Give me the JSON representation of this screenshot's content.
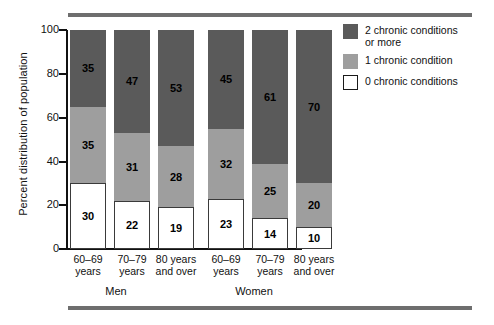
{
  "chart_data": {
    "type": "bar",
    "subtype": "stacked-bar-100",
    "title": "",
    "xlabel": "",
    "ylabel": "Percent distribution of population",
    "ylim": [
      0,
      100
    ],
    "yticks": [
      0,
      20,
      40,
      60,
      80,
      100
    ],
    "ytick_labels": [
      "0",
      "20",
      "40",
      "60",
      "80",
      "100"
    ],
    "grid": false,
    "legend_position": "right",
    "groups": [
      {
        "name": "Men",
        "categories": [
          "60–69 years",
          "70–79 years",
          "80 years and over"
        ]
      },
      {
        "name": "Women",
        "categories": [
          "60–69 years",
          "70–79 years",
          "80 years and over"
        ]
      }
    ],
    "categories": [
      "Men 60–69 years",
      "Men 70–79 years",
      "Men 80 years and over",
      "Women 60–69 years",
      "Women 70–79 years",
      "Women 80 years and over"
    ],
    "series": [
      {
        "name": "0 chronic conditions",
        "color": "#ffffff",
        "values": [
          30,
          22,
          19,
          23,
          14,
          10
        ]
      },
      {
        "name": "1 chronic condition",
        "color": "#9e9e9e",
        "values": [
          35,
          31,
          28,
          32,
          25,
          20
        ]
      },
      {
        "name": "2 chronic conditions or more",
        "color": "#5a5a5a",
        "values": [
          35,
          47,
          53,
          45,
          61,
          70
        ]
      }
    ]
  },
  "axis": {
    "y_title": "Percent distribution of population",
    "y_ticks": [
      {
        "label": "100",
        "value": 100
      },
      {
        "label": "80",
        "value": 80
      },
      {
        "label": "60",
        "value": 60
      },
      {
        "label": "40",
        "value": 40
      },
      {
        "label": "20",
        "value": 20
      },
      {
        "label": "0",
        "value": 0
      }
    ]
  },
  "bars": [
    {
      "group": "Men",
      "age_line1": "60–69",
      "age_line2": "years",
      "s0": 30,
      "s1": 35,
      "s2": 35
    },
    {
      "group": "Men",
      "age_line1": "70–79",
      "age_line2": "years",
      "s0": 22,
      "s1": 31,
      "s2": 47
    },
    {
      "group": "Men",
      "age_line1": "80 years",
      "age_line2": "and over",
      "s0": 19,
      "s1": 28,
      "s2": 53
    },
    {
      "group": "Women",
      "age_line1": "60–69",
      "age_line2": "years",
      "s0": 23,
      "s1": 32,
      "s2": 45
    },
    {
      "group": "Women",
      "age_line1": "70–79",
      "age_line2": "years",
      "s0": 14,
      "s1": 25,
      "s2": 61
    },
    {
      "group": "Women",
      "age_line1": "80 years",
      "age_line2": "and over",
      "s0": 10,
      "s1": 20,
      "s2": 70
    }
  ],
  "group_labels": [
    {
      "label": "Men"
    },
    {
      "label": "Women"
    }
  ],
  "legend": {
    "items": [
      {
        "label_line1": "2 chronic conditions",
        "label_line2": "or more",
        "swatch": "dark"
      },
      {
        "label_line1": "1 chronic condition",
        "label_line2": "",
        "swatch": "medium"
      },
      {
        "label_line1": "0 chronic conditions",
        "label_line2": "",
        "swatch": "white"
      }
    ]
  },
  "colors": {
    "two_or_more": "#5a5a5a",
    "one": "#9e9e9e",
    "zero": "#ffffff",
    "rule": "#6e6e6e",
    "axis": "#111111"
  }
}
